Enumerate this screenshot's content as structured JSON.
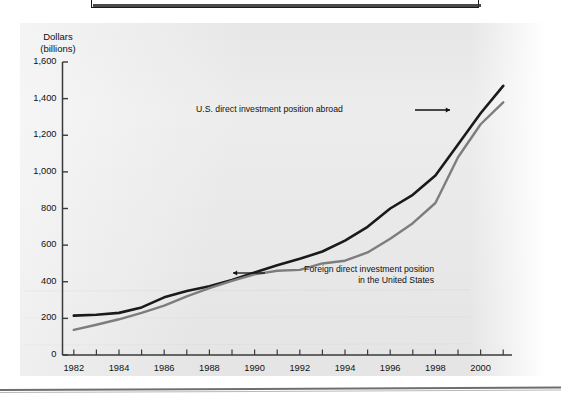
{
  "figure": {
    "y_axis_title": "Dollars\n(billions)"
  },
  "chart_data": {
    "type": "line",
    "title": "",
    "xlabel": "",
    "ylabel": "Dollars (billions)",
    "xlim": [
      1981.5,
      2001.3
    ],
    "ylim": [
      0,
      1600
    ],
    "grid": false,
    "legend_position": "inline-annotations",
    "y_ticks": [
      0,
      200,
      400,
      600,
      800,
      1000,
      1200,
      1400,
      1600
    ],
    "y_tick_labels": [
      "0",
      "200",
      "400",
      "600",
      "800",
      "1,000",
      "1,200",
      "1,400",
      "1,600"
    ],
    "x_ticks": [
      1982,
      1983,
      1984,
      1985,
      1986,
      1987,
      1988,
      1989,
      1990,
      1991,
      1992,
      1993,
      1994,
      1995,
      1996,
      1997,
      1998,
      1999,
      2000,
      2001
    ],
    "x_tick_labels": [
      "1982",
      "",
      "1984",
      "",
      "1986",
      "",
      "1988",
      "",
      "1990",
      "",
      "1992",
      "",
      "1994",
      "",
      "1996",
      "",
      "1998",
      "",
      "2000",
      ""
    ],
    "x_labeled_ticks": [
      {
        "x": 1982,
        "label": "1982"
      },
      {
        "x": 1984,
        "label": "1984"
      },
      {
        "x": 1986,
        "label": "1986"
      },
      {
        "x": 1988,
        "label": "1988"
      },
      {
        "x": 1990,
        "label": "1990"
      },
      {
        "x": 1992,
        "label": "1992"
      },
      {
        "x": 1994,
        "label": "1994"
      },
      {
        "x": 1996,
        "label": "1996"
      },
      {
        "x": 1998,
        "label": "1998"
      },
      {
        "x": 2000,
        "label": "2000"
      }
    ],
    "x": [
      1982,
      1983,
      1984,
      1985,
      1986,
      1987,
      1988,
      1989,
      1990,
      1991,
      1992,
      1993,
      1994,
      1995,
      1996,
      1997,
      1998,
      1999,
      2000,
      2001
    ],
    "series": [
      {
        "name": "U.S. direct investment position abroad",
        "color": "#1a1a1a",
        "values": [
          215,
          220,
          230,
          260,
          315,
          350,
          375,
          410,
          450,
          490,
          525,
          565,
          625,
          700,
          800,
          875,
          980,
          1150,
          1320,
          1470
        ]
      },
      {
        "name": "Foreign direct investment position in the United States",
        "color": "#7d7d7d",
        "values": [
          137,
          165,
          195,
          230,
          270,
          320,
          365,
          405,
          440,
          460,
          465,
          500,
          515,
          560,
          635,
          720,
          830,
          1080,
          1260,
          1380
        ]
      }
    ],
    "annotations": [
      {
        "id": "us-abroad",
        "text": "U.S. direct investment position abroad",
        "arrow": "right"
      },
      {
        "id": "foreign-in-us",
        "text": "Foreign direct investment position\nin the United States",
        "arrow": "left"
      }
    ]
  }
}
